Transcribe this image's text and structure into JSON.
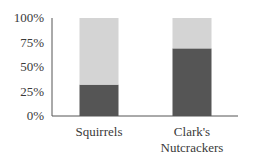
{
  "chart_data": {
    "type": "bar",
    "stacked": true,
    "title": "",
    "xlabel": "",
    "ylabel": "",
    "ylim": [
      0,
      100
    ],
    "yticks": [
      "0%",
      "25%",
      "50%",
      "75%",
      "100%"
    ],
    "ytick_values": [
      0,
      25,
      50,
      75,
      100
    ],
    "grid": false,
    "legend": "none",
    "categories": [
      {
        "lines": [
          "Squirrels"
        ]
      },
      {
        "lines": [
          "Clark's",
          "Nutcrackers"
        ]
      }
    ],
    "series": [
      {
        "name": "dark segment",
        "color": "#555555",
        "values": [
          32,
          69
        ]
      },
      {
        "name": "light segment",
        "color": "#d4d4d4",
        "values": [
          68,
          31
        ]
      }
    ]
  }
}
